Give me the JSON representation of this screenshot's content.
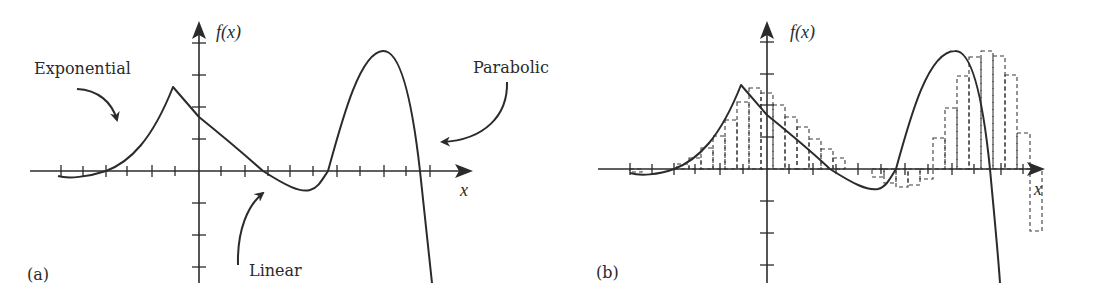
{
  "panels": [
    {
      "id": "a",
      "panel_label": "(a)",
      "y_axis_label": "f(x)",
      "x_axis_label": "x",
      "annotations": [
        {
          "text": "Exponential",
          "points_to": "left rising segment"
        },
        {
          "text": "Linear",
          "points_to": "descending segment"
        },
        {
          "text": "Parabolic",
          "points_to": "right hump"
        }
      ]
    },
    {
      "id": "b",
      "panel_label": "(b)",
      "y_axis_label": "f(x)",
      "x_axis_label": "x",
      "overlay": "dashed step-function (piecewise-constant) approximation of f(x)"
    }
  ],
  "labels": {
    "exponential": "Exponential",
    "linear": "Linear",
    "parabolic": "Parabolic",
    "fx_a": "f(x)",
    "fx_b": "f(x)",
    "x_a": "x",
    "x_b": "x",
    "panel_a": "(a)",
    "panel_b": "(b)"
  },
  "colors": {
    "line": "#2b2b2b",
    "background": "#ffffff"
  }
}
